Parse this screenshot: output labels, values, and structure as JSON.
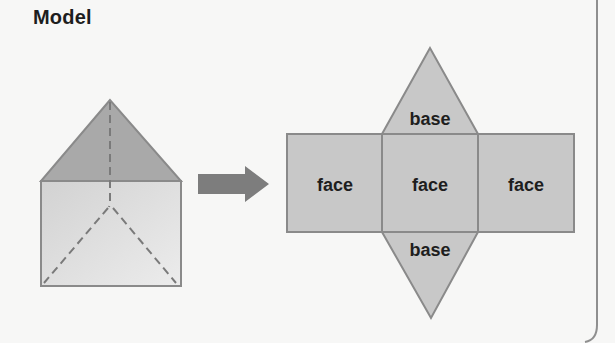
{
  "title": "Model",
  "colors": {
    "background": "#f7f7f6",
    "net_fill": "#c8c8c8",
    "stroke": "#8a8a8a",
    "prism_top_fill": "#a6a6a6",
    "arrow_fill": "#7d7d7d",
    "text": "#1e1e1e"
  },
  "prism": {
    "name": "triangular prism",
    "hidden_edges": "dashed"
  },
  "arrow": {
    "direction": "right"
  },
  "net": {
    "top_base_label": "base",
    "faces": [
      "face",
      "face",
      "face"
    ],
    "bottom_base_label": "base"
  }
}
